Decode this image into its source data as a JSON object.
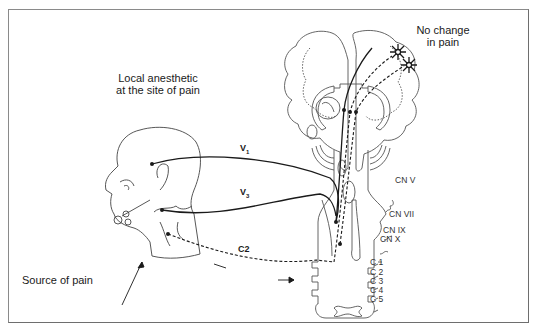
{
  "figure": {
    "title_left": [
      "Local anesthetic",
      "at the site of pain"
    ],
    "title_right": [
      "No change",
      "in pain"
    ],
    "source_label": "Source of pain",
    "nerves": {
      "v1": {
        "base": "V",
        "sub": "1"
      },
      "v3": {
        "base": "V",
        "sub": "3"
      },
      "c2": "C2"
    },
    "cranial_nerves": [
      "CN V",
      "CN VII",
      "CN IX",
      "CN X"
    ],
    "cervical_levels": [
      "C 1",
      "C 2",
      "C 3",
      "C 4",
      "C 5"
    ],
    "colors": {
      "line": "#1a1a1a",
      "outline": "#555555",
      "frame": "#8a8a8a",
      "background": "#ffffff"
    }
  }
}
